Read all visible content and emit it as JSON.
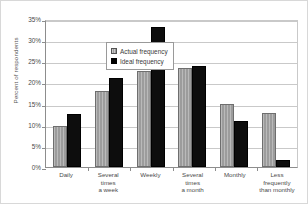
{
  "chart_data": {
    "type": "bar",
    "title": "",
    "xlabel": "",
    "ylabel": "Percent of respondents",
    "ylim": [
      0,
      35
    ],
    "ytick_labels": [
      "35%",
      "30%",
      "25%",
      "20%",
      "15%",
      "10%",
      "5%",
      "0%"
    ],
    "ytick_values": [
      35,
      30,
      25,
      20,
      15,
      10,
      5,
      0
    ],
    "grid": true,
    "legend_position": "top-left inside plot",
    "categories": [
      "Daily",
      "Several times a week",
      "Weekly",
      "Several times a month",
      "Monthly",
      "Less frequently than monthly"
    ],
    "category_lines": [
      [
        "Daily"
      ],
      [
        "Several",
        "times",
        "a week"
      ],
      [
        "Weekly"
      ],
      [
        "Several",
        "times",
        "a month"
      ],
      [
        "Monthly"
      ],
      [
        "Less",
        "frequently",
        "than monthly"
      ]
    ],
    "series": [
      {
        "name": "Actual frequency",
        "color": "#9c9c9c",
        "values": [
          9.8,
          18.0,
          22.7,
          23.3,
          14.8,
          12.8
        ]
      },
      {
        "name": "Ideal frequency",
        "color": "#0d0d0d",
        "values": [
          12.5,
          21.0,
          33.0,
          23.8,
          10.8,
          1.7
        ]
      }
    ]
  },
  "legend": {
    "items": [
      {
        "label": "Actual frequency",
        "icon": "legend-swatch-hatched-gray"
      },
      {
        "label": "Ideal frequency",
        "icon": "legend-swatch-solid-black"
      }
    ]
  }
}
